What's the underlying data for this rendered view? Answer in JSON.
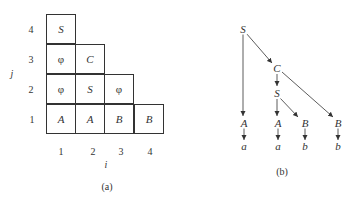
{
  "figure_a": {
    "caption": "(a)",
    "x_axis_label": "i",
    "y_axis_label": "j",
    "x_ticks": [
      "1",
      "2",
      "3",
      "4"
    ],
    "y_ticks": [
      "1",
      "2",
      "3",
      "4"
    ],
    "rows": [
      {
        "j": "4",
        "cells": [
          "S"
        ]
      },
      {
        "j": "3",
        "cells": [
          "φ",
          "C"
        ]
      },
      {
        "j": "2",
        "cells": [
          "φ",
          "S",
          "φ"
        ]
      },
      {
        "j": "1",
        "cells": [
          "A",
          "A",
          "B",
          "B"
        ]
      }
    ]
  },
  "figure_b": {
    "caption": "(b)",
    "nodes": {
      "root": "S",
      "c": "C",
      "s2": "S",
      "a1": "A",
      "a2": "A",
      "b1": "B",
      "b2": "B",
      "t1": "a",
      "t2": "a",
      "t3": "b",
      "t4": "b"
    },
    "edges": [
      [
        "S",
        "A"
      ],
      [
        "S",
        "C"
      ],
      [
        "C",
        "S"
      ],
      [
        "C",
        "B"
      ],
      [
        "S",
        "A"
      ],
      [
        "S",
        "B"
      ],
      [
        "A",
        "a"
      ],
      [
        "A",
        "a"
      ],
      [
        "B",
        "b"
      ],
      [
        "B",
        "b"
      ]
    ]
  }
}
